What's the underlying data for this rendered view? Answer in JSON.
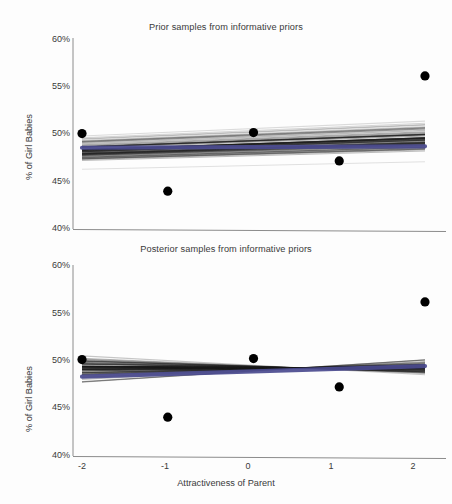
{
  "figure": {
    "width": 452,
    "height": 504,
    "background": "#fdfdfd"
  },
  "chart_data": [
    {
      "type": "line",
      "panel": "top",
      "title": "Prior samples from informative priors",
      "xlabel": "Attractiveness of Parent",
      "ylabel": "% of Girl Babies",
      "x_ticks": [
        "-2",
        "-1",
        "0",
        "1",
        "2"
      ],
      "x_tick_values": [
        -2,
        -1,
        0,
        1,
        2
      ],
      "y_ticks": [
        "40%",
        "45%",
        "50%",
        "55%",
        "60%"
      ],
      "y_tick_values": [
        40,
        45,
        50,
        55,
        60
      ],
      "xlim": [
        -2.0,
        2.0
      ],
      "ylim": [
        40,
        60
      ],
      "grid": false,
      "legend": "none",
      "series": [
        {
          "name": "observed data points",
          "type": "scatter",
          "marker": "filled-circle",
          "color": "#000000",
          "x": [
            -2,
            -1,
            0,
            1,
            2
          ],
          "values": [
            50.1,
            44.0,
            50.2,
            47.2,
            56.2
          ]
        },
        {
          "name": "posterior mean line",
          "type": "line",
          "color": "#4b4b8f",
          "x": [
            -2,
            2
          ],
          "values": [
            48.6,
            48.75
          ]
        },
        {
          "name": "prior draw lines",
          "type": "line-bundle",
          "color": "#1a1a1a",
          "count": 60,
          "description": "overplotted regression lines drawn from the informative prior",
          "x": [
            -2,
            2
          ],
          "intercept_at_x0": 48.6,
          "slope_spread_percent_per_unit": 0.45,
          "endpoints_left": [
            45.9,
            50.4
          ],
          "endpoints_right": [
            46.6,
            52.1
          ]
        }
      ]
    },
    {
      "type": "line",
      "panel": "bottom",
      "title": "Posterior samples from informative priors",
      "xlabel": "Attractiveness of Parent",
      "ylabel": "% of Girl Babies",
      "x_ticks": [
        "-2",
        "-1",
        "0",
        "1",
        "2"
      ],
      "x_tick_values": [
        -2,
        -1,
        0,
        1,
        2
      ],
      "y_ticks": [
        "40%",
        "45%",
        "50%",
        "55%",
        "60%"
      ],
      "y_tick_values": [
        40,
        45,
        50,
        55,
        60
      ],
      "xlim": [
        -2.0,
        2.0
      ],
      "ylim": [
        40,
        60
      ],
      "grid": false,
      "legend": "none",
      "series": [
        {
          "name": "observed data points",
          "type": "scatter",
          "marker": "filled-circle",
          "color": "#000000",
          "x": [
            -2,
            -1,
            0,
            1,
            2
          ],
          "values": [
            50.1,
            44.0,
            50.2,
            47.2,
            56.2
          ]
        },
        {
          "name": "posterior mean line",
          "type": "line",
          "color": "#4b4b8f",
          "x": [
            -2,
            2
          ],
          "values": [
            48.3,
            49.4
          ]
        },
        {
          "name": "posterior draw lines",
          "type": "line-bundle",
          "color": "#1a1a1a",
          "count": 60,
          "description": "overplotted regression lines drawn from the posterior",
          "x": [
            -2,
            2
          ],
          "intercept_at_x0": 48.8,
          "slope_spread_percent_per_unit": 0.5,
          "endpoints_left": [
            46.6,
            51.7
          ],
          "endpoints_right": [
            47.8,
            50.7
          ]
        }
      ]
    }
  ],
  "colors": {
    "axis": "#8c8c8c",
    "text": "#3a3a3a",
    "point": "#000000",
    "mean_line": "#4b4b8f",
    "draw_lines": "#1a1a1a"
  }
}
